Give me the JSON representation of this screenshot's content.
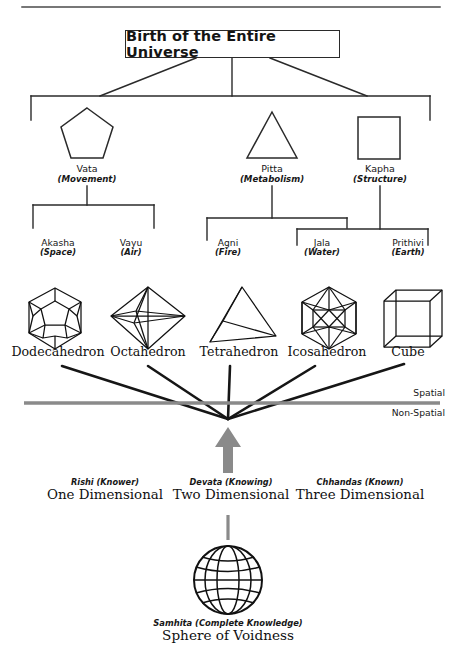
{
  "page": {
    "top_rule": true,
    "colors": {
      "ink": "#2a2a2a",
      "gray_divider": "#8a8a8a",
      "gray_arrow": "#8a8a8a",
      "background": "#ffffff"
    }
  },
  "root": {
    "label": "Birth of the Entire Universe"
  },
  "doshas": [
    {
      "name": "Vata",
      "sub": "(Movement)",
      "shape": "pentagon-icon"
    },
    {
      "name": "Pitta",
      "sub": "(Metabolism)",
      "shape": "triangle-icon"
    },
    {
      "name": "Kapha",
      "sub": "(Structure)",
      "shape": "square-icon"
    }
  ],
  "elements": [
    {
      "name": "Akasha",
      "sub": "(Space)"
    },
    {
      "name": "Vayu",
      "sub": "(Air)"
    },
    {
      "name": "Agni",
      "sub": "(Fire)"
    },
    {
      "name": "Jala",
      "sub": "(Water)"
    },
    {
      "name": "Prithivi",
      "sub": "(Earth)"
    }
  ],
  "solids": [
    {
      "name": "Dodecahedron",
      "icon": "dodecahedron-icon"
    },
    {
      "name": "Octahedron",
      "icon": "octahedron-icon"
    },
    {
      "name": "Tetrahedron",
      "icon": "tetrahedron-icon"
    },
    {
      "name": "Icosahedron",
      "icon": "icosahedron-icon"
    },
    {
      "name": "Cube",
      "icon": "cube-icon"
    }
  ],
  "divider": {
    "above_label": "Spatial",
    "below_label": "Non-Spatial"
  },
  "dimensions": [
    {
      "sub": "Rishi (Knower)",
      "name": "One Dimensional"
    },
    {
      "sub": "Devata (Knowing)",
      "name": "Two Dimensional"
    },
    {
      "sub": "Chhandas (Known)",
      "name": "Three Dimensional"
    }
  ],
  "samhita": {
    "sub": "Samhita (Complete Knowledge)",
    "name": "Sphere of Voidness",
    "icon": "sphere-wireframe-icon"
  }
}
